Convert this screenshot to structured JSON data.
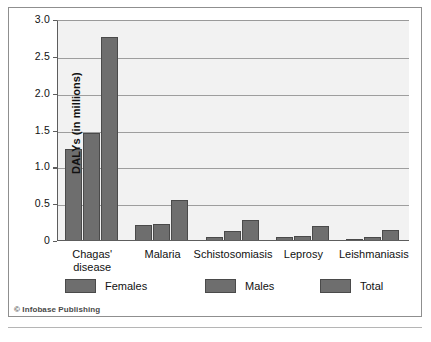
{
  "chart_data": {
    "type": "bar",
    "title": "",
    "xlabel": "",
    "ylabel": "DALYs (in millions)",
    "ylim": [
      0,
      3.0
    ],
    "ytick_labels": [
      "0",
      "0.5",
      "1.0",
      "1.5",
      "2.0",
      "2.5",
      "3.0"
    ],
    "ytick_values": [
      0,
      0.5,
      1.0,
      1.5,
      2.0,
      2.5,
      3.0
    ],
    "grid": "horizontal",
    "legend_position": "bottom",
    "categories": [
      "Chagas'\ndisease",
      "Malaria",
      "Schistosomiasis",
      "Leprosy",
      "Leishmaniasis"
    ],
    "series": [
      {
        "name": "Females",
        "values": [
          1.25,
          0.22,
          0.06,
          0.05,
          0.03
        ]
      },
      {
        "name": "Males",
        "values": [
          1.47,
          0.23,
          0.13,
          0.07,
          0.05
        ]
      },
      {
        "name": "Total",
        "values": [
          2.77,
          0.56,
          0.28,
          0.2,
          0.15
        ]
      }
    ],
    "bar_color": "#6e6e6e",
    "bar_border_color": "#4a4a4a",
    "plot_background": "#f2f2f2",
    "gridline_color": "#9e9e9e",
    "axis_color": "#5d5d5d"
  },
  "legend": {
    "items": [
      {
        "label": "Females"
      },
      {
        "label": "Males"
      },
      {
        "label": "Total"
      }
    ]
  },
  "credit": {
    "text": "© Infobase Publishing"
  }
}
